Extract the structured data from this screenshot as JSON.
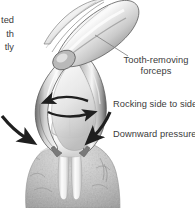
{
  "figure": {
    "background_color": "#ffffff",
    "text_color": "#3b3b3b",
    "style": "grayscale medical illustration"
  },
  "labels": {
    "forceps": "Tooth-removing forceps",
    "rocking": "Rocking side to side",
    "downward": "Downward pressure"
  },
  "clipped_text": {
    "line1": "ted",
    "line2": "th",
    "line3": "tly"
  },
  "annotations": {
    "leader_line": "leader-line",
    "rocking_arrow_upper": "double-headed horizontal arrow pointing left",
    "rocking_arrow_lower": "double-headed horizontal arrow pointing right",
    "pressure_arrow_left": "curved arrow pointing down-right",
    "pressure_arrow_right": "curved arrow pointing down-left"
  },
  "anatomy": {
    "forceps_handle": "forceps-handle",
    "forceps_beaks": "forceps-beaks",
    "tooth_crown": "molar-crown",
    "tooth_roots": "molar-roots",
    "bone": "alveolar-bone"
  },
  "colors": {
    "outline": "#4a4a4a",
    "arrow": "#1f1f1f",
    "metal_light": "#fdfdfd",
    "metal_mid": "#b4b4b4",
    "metal_dark": "#5c5c5c",
    "tooth_light": "#ffffff",
    "tooth_shade": "#d6d6d6",
    "bone_light": "#d9d9d9",
    "bone_dark": "#9a9a9a",
    "leader": "#7d7d7d"
  }
}
